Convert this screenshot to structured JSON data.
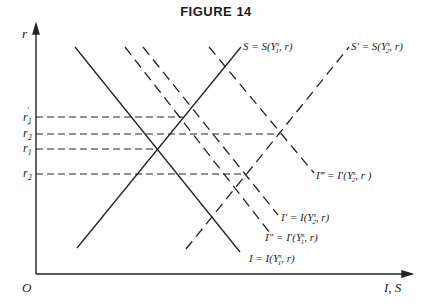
{
  "figure": {
    "title": "FIGURE 14",
    "y_axis_label": "r",
    "x_axis_label": "I, S",
    "origin_label": "O"
  },
  "rate_labels": [
    {
      "id": "r1_prime",
      "base": "r",
      "sub": "1",
      "sup": "′"
    },
    {
      "id": "r2_prime",
      "base": "r",
      "sub": "2",
      "sup": "′"
    },
    {
      "id": "r1",
      "base": "r",
      "sub": "1",
      "sup": ""
    },
    {
      "id": "r2",
      "base": "r",
      "sub": "2",
      "sup": ""
    }
  ],
  "curves": {
    "S": {
      "label": "S = S(Y",
      "sub": "1",
      "sup": "s",
      "tail": ", r)",
      "style": "solid"
    },
    "S_p": {
      "label": "S′ = S(Y",
      "sub": "2",
      "sup": "s",
      "tail": ", r)",
      "style": "dashed"
    },
    "I": {
      "label": "I = I(Y",
      "sub": "1",
      "sup": "s",
      "tail": ", r)",
      "style": "solid"
    },
    "I_p": {
      "label": "I′ = I(Y",
      "sub": "2",
      "sup": "s",
      "tail": ", r)",
      "style": "dashed"
    },
    "I_pp": {
      "label": "I″ = I′(Y",
      "sub": "1",
      "sup": "s",
      "tail": ", r)",
      "style": "dashed"
    },
    "I_ppp": {
      "label": "I‴ = I′(Y",
      "sub": "2",
      "sup": "s",
      "tail": ", r )",
      "style": "dashed"
    }
  },
  "colors": {
    "ink": "#222222",
    "background": "#ffffff"
  }
}
